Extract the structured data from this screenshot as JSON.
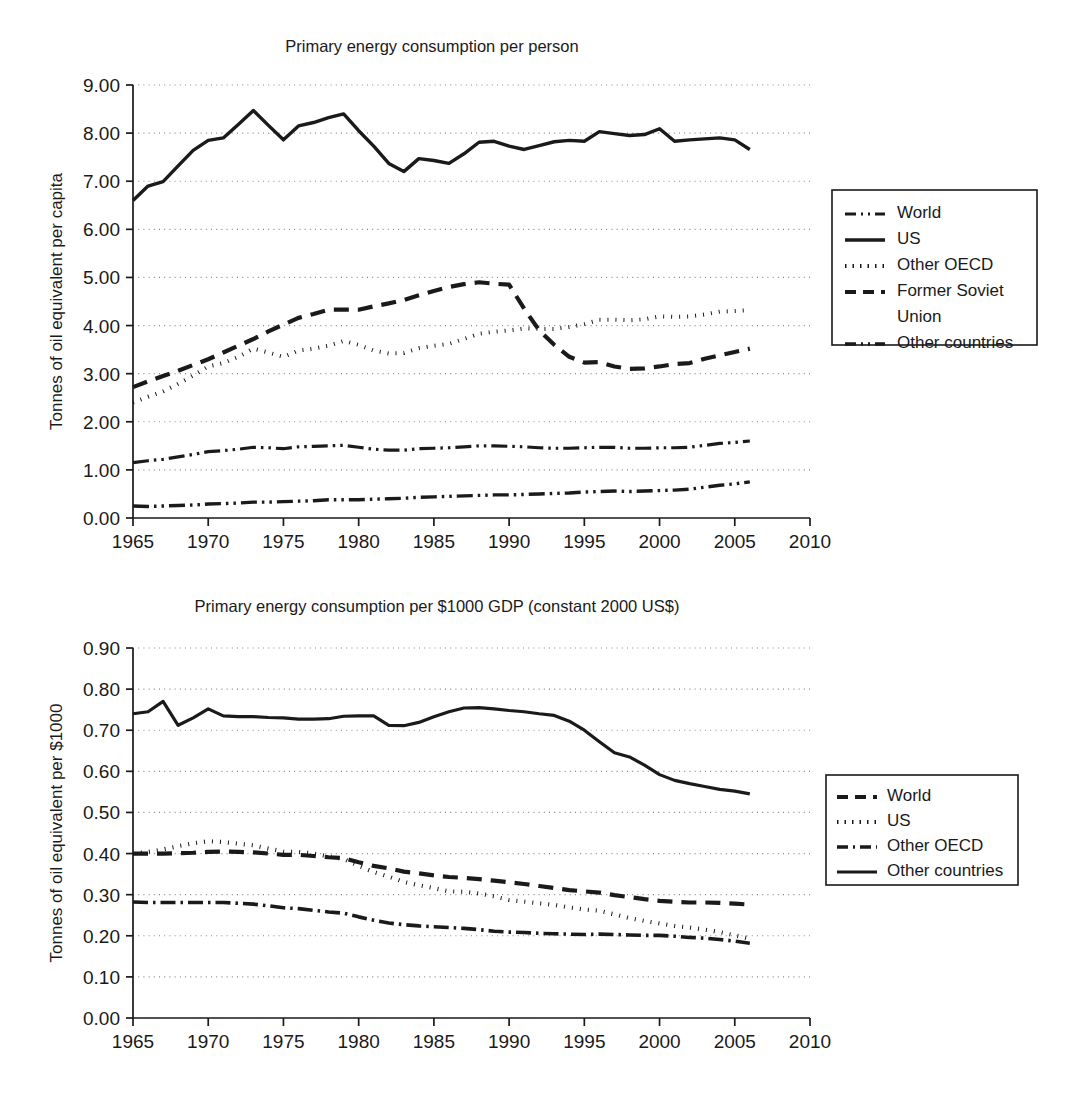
{
  "page": {
    "background": "#ffffff",
    "ink": "#1a1a1a",
    "grid_color": "#8a8a8a"
  },
  "chart_data": [
    {
      "id": "per-person",
      "type": "line",
      "title": "Primary energy consumption per person",
      "xlabel": "",
      "ylabel": "Tonnes of oil equivalent per capita",
      "xlim": [
        1965,
        2010
      ],
      "ylim": [
        0.0,
        9.0
      ],
      "xticks": [
        1965,
        1970,
        1975,
        1980,
        1985,
        1990,
        1995,
        2000,
        2005,
        2010
      ],
      "xtick_labels": [
        "1965",
        "1970",
        "1975",
        "1980",
        "1985",
        "1990",
        "1995",
        "2000",
        "2005",
        "2010"
      ],
      "yticks": [
        0.0,
        1.0,
        2.0,
        3.0,
        4.0,
        5.0,
        6.0,
        7.0,
        8.0,
        9.0
      ],
      "ytick_labels": [
        "0.00",
        "1.00",
        "2.00",
        "3.00",
        "4.00",
        "5.00",
        "6.00",
        "7.00",
        "8.00",
        "9.00"
      ],
      "grid": "horizontal-dotted",
      "legend_position": "right",
      "x": [
        1965,
        1966,
        1967,
        1968,
        1969,
        1970,
        1971,
        1972,
        1973,
        1974,
        1975,
        1976,
        1977,
        1978,
        1979,
        1980,
        1981,
        1982,
        1983,
        1984,
        1985,
        1986,
        1987,
        1988,
        1989,
        1990,
        1991,
        1992,
        1993,
        1994,
        1995,
        1996,
        1997,
        1998,
        1999,
        2000,
        2001,
        2002,
        2003,
        2004,
        2005,
        2006
      ],
      "series": [
        {
          "name": "World",
          "dash": "dash-dot-dot",
          "stroke_width": 3.2,
          "dasharray": "16 5 2.5 5 2.5 5",
          "values": [
            1.15,
            1.19,
            1.22,
            1.27,
            1.32,
            1.38,
            1.4,
            1.43,
            1.47,
            1.46,
            1.44,
            1.48,
            1.49,
            1.5,
            1.51,
            1.47,
            1.43,
            1.41,
            1.41,
            1.44,
            1.45,
            1.46,
            1.48,
            1.5,
            1.5,
            1.49,
            1.48,
            1.46,
            1.45,
            1.45,
            1.46,
            1.47,
            1.47,
            1.45,
            1.45,
            1.46,
            1.46,
            1.47,
            1.51,
            1.55,
            1.57,
            1.6
          ]
        },
        {
          "name": "US",
          "dash": "solid",
          "stroke_width": 3.4,
          "dasharray": "",
          "values": [
            6.6,
            6.9,
            6.99,
            7.32,
            7.64,
            7.85,
            7.9,
            8.18,
            8.47,
            8.16,
            7.86,
            8.15,
            8.22,
            8.32,
            8.4,
            8.05,
            7.73,
            7.37,
            7.2,
            7.47,
            7.43,
            7.37,
            7.57,
            7.81,
            7.83,
            7.73,
            7.66,
            7.74,
            7.82,
            7.85,
            7.83,
            8.03,
            7.99,
            7.95,
            7.97,
            8.09,
            7.83,
            7.86,
            7.88,
            7.9,
            7.86,
            7.66
          ]
        },
        {
          "name": "Other OECD",
          "dash": "dotted",
          "stroke_width": 4.0,
          "dasharray": "1 7",
          "values": [
            2.4,
            2.52,
            2.63,
            2.79,
            2.96,
            3.15,
            3.22,
            3.35,
            3.52,
            3.44,
            3.35,
            3.48,
            3.52,
            3.58,
            3.68,
            3.6,
            3.48,
            3.42,
            3.43,
            3.53,
            3.58,
            3.62,
            3.72,
            3.83,
            3.87,
            3.9,
            3.94,
            3.93,
            3.93,
            3.97,
            4.03,
            4.12,
            4.12,
            4.11,
            4.13,
            4.19,
            4.18,
            4.19,
            4.23,
            4.29,
            4.3,
            4.32
          ]
        },
        {
          "name": "Former Soviet Union",
          "dash": "dashed",
          "stroke_width": 4.2,
          "dasharray": "15 9",
          "values": [
            2.72,
            2.84,
            2.95,
            3.06,
            3.18,
            3.3,
            3.44,
            3.58,
            3.72,
            3.88,
            4.02,
            4.16,
            4.24,
            4.33,
            4.33,
            4.33,
            4.4,
            4.46,
            4.53,
            4.63,
            4.72,
            4.8,
            4.86,
            4.9,
            4.87,
            4.85,
            4.35,
            3.9,
            3.6,
            3.35,
            3.23,
            3.24,
            3.15,
            3.1,
            3.11,
            3.15,
            3.2,
            3.22,
            3.31,
            3.38,
            3.45,
            3.52
          ]
        },
        {
          "name": "Other countries",
          "dash": "dash-dot-dot",
          "stroke_width": 3.4,
          "dasharray": "16 5 2.5 5 2.5 5",
          "values": [
            0.25,
            0.24,
            0.25,
            0.26,
            0.27,
            0.29,
            0.3,
            0.31,
            0.33,
            0.33,
            0.34,
            0.35,
            0.36,
            0.38,
            0.38,
            0.38,
            0.39,
            0.4,
            0.41,
            0.43,
            0.44,
            0.45,
            0.46,
            0.47,
            0.48,
            0.48,
            0.49,
            0.5,
            0.51,
            0.52,
            0.54,
            0.55,
            0.56,
            0.55,
            0.56,
            0.57,
            0.58,
            0.6,
            0.64,
            0.68,
            0.71,
            0.75
          ]
        }
      ]
    },
    {
      "id": "per-1000-gdp",
      "type": "line",
      "title": "Primary energy consumption per $1000 GDP (constant 2000 US$)",
      "xlabel": "",
      "ylabel": "Tonnes of oil equivalent per $1000",
      "xlim": [
        1965,
        2010
      ],
      "ylim": [
        0.0,
        0.9
      ],
      "xticks": [
        1965,
        1970,
        1975,
        1980,
        1985,
        1990,
        1995,
        2000,
        2005,
        2010
      ],
      "xtick_labels": [
        "1965",
        "1970",
        "1975",
        "1980",
        "1985",
        "1990",
        "1995",
        "2000",
        "2005",
        "2010"
      ],
      "yticks": [
        0.0,
        0.1,
        0.2,
        0.3,
        0.4,
        0.5,
        0.6,
        0.7,
        0.8,
        0.9
      ],
      "ytick_labels": [
        "0.00",
        "0.10",
        "0.20",
        "0.30",
        "0.40",
        "0.50",
        "0.60",
        "0.70",
        "0.80",
        "0.90"
      ],
      "grid": "horizontal-dotted",
      "legend_position": "right",
      "x": [
        1965,
        1966,
        1967,
        1968,
        1969,
        1970,
        1971,
        1972,
        1973,
        1974,
        1975,
        1976,
        1977,
        1978,
        1979,
        1980,
        1981,
        1982,
        1983,
        1984,
        1985,
        1986,
        1987,
        1988,
        1989,
        1990,
        1991,
        1992,
        1993,
        1994,
        1995,
        1996,
        1997,
        1998,
        1999,
        2000,
        2001,
        2002,
        2003,
        2004,
        2005,
        2006
      ],
      "series": [
        {
          "name": "World",
          "dash": "dashed",
          "stroke_width": 4.2,
          "dasharray": "15 9",
          "values": [
            0.4,
            0.4,
            0.4,
            0.401,
            0.402,
            0.404,
            0.405,
            0.404,
            0.403,
            0.4,
            0.397,
            0.397,
            0.394,
            0.391,
            0.389,
            0.379,
            0.37,
            0.364,
            0.356,
            0.352,
            0.347,
            0.343,
            0.341,
            0.338,
            0.334,
            0.33,
            0.326,
            0.321,
            0.316,
            0.311,
            0.308,
            0.305,
            0.299,
            0.294,
            0.289,
            0.285,
            0.283,
            0.281,
            0.281,
            0.28,
            0.278,
            0.276
          ]
        },
        {
          "name": "US",
          "dash": "dotted",
          "stroke_width": 4.2,
          "dasharray": "1 7",
          "values": [
            0.4,
            0.404,
            0.41,
            0.418,
            0.425,
            0.43,
            0.428,
            0.424,
            0.42,
            0.412,
            0.405,
            0.404,
            0.4,
            0.393,
            0.387,
            0.37,
            0.355,
            0.344,
            0.331,
            0.323,
            0.316,
            0.308,
            0.307,
            0.303,
            0.296,
            0.287,
            0.283,
            0.279,
            0.275,
            0.269,
            0.264,
            0.261,
            0.252,
            0.243,
            0.236,
            0.23,
            0.224,
            0.22,
            0.215,
            0.209,
            0.201,
            0.193
          ]
        },
        {
          "name": "Other OECD",
          "dash": "dash-dot",
          "stroke_width": 3.6,
          "dasharray": "15 5 2.5 5",
          "values": [
            0.282,
            0.281,
            0.281,
            0.281,
            0.281,
            0.281,
            0.281,
            0.279,
            0.277,
            0.273,
            0.268,
            0.266,
            0.262,
            0.258,
            0.255,
            0.246,
            0.238,
            0.231,
            0.227,
            0.224,
            0.222,
            0.22,
            0.218,
            0.215,
            0.211,
            0.209,
            0.208,
            0.206,
            0.205,
            0.204,
            0.203,
            0.204,
            0.203,
            0.202,
            0.201,
            0.201,
            0.199,
            0.196,
            0.194,
            0.191,
            0.187,
            0.182
          ]
        },
        {
          "name": "Other countries",
          "dash": "solid",
          "stroke_width": 3.2,
          "dasharray": "",
          "values": [
            0.74,
            0.745,
            0.77,
            0.712,
            0.73,
            0.752,
            0.735,
            0.733,
            0.733,
            0.731,
            0.73,
            0.727,
            0.727,
            0.728,
            0.734,
            0.735,
            0.735,
            0.712,
            0.711,
            0.719,
            0.733,
            0.745,
            0.754,
            0.755,
            0.752,
            0.748,
            0.745,
            0.74,
            0.736,
            0.722,
            0.7,
            0.672,
            0.645,
            0.635,
            0.615,
            0.592,
            0.578,
            0.57,
            0.563,
            0.556,
            0.552,
            0.545
          ]
        }
      ]
    }
  ]
}
